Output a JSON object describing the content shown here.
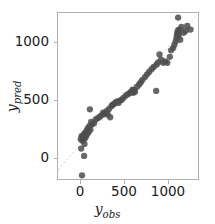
{
  "figure": {
    "background": "#ffffff",
    "plot_box_color": "#b0b0b0"
  },
  "axes": {
    "xlabel_var": "y",
    "xlabel_sub": "obs",
    "ylabel_var": "y",
    "ylabel_sub": "pred",
    "x_ticks": [
      "0",
      "500",
      "1000"
    ],
    "y_ticks": [
      "0",
      "500",
      "1000"
    ]
  },
  "chart_data": {
    "type": "scatter",
    "title": "",
    "xlabel": "y_obs",
    "ylabel": "y_pred",
    "xlim": [
      -260,
      1430
    ],
    "ylim": [
      -360,
      1440
    ],
    "x_ticks": [
      0,
      500,
      1000
    ],
    "y_ticks": [
      0,
      500,
      1000
    ],
    "grid": false,
    "legend": null,
    "marker_color": "#4d4d4d",
    "marker_size": 3.2,
    "marker_alpha": 0.85,
    "reference_line": {
      "name": "identity",
      "style": "dashed",
      "color": "#c8c8c8",
      "slope": 1,
      "intercept": 0,
      "from": [
        -260,
        -260
      ],
      "to": [
        1400,
        1400
      ]
    },
    "series": [
      {
        "name": "predictions",
        "points": [
          [
            30,
            -320
          ],
          [
            55,
            -110
          ],
          [
            20,
            -30
          ],
          [
            60,
            20
          ],
          [
            35,
            55
          ],
          [
            15,
            70
          ],
          [
            45,
            75
          ],
          [
            70,
            85
          ],
          [
            30,
            95
          ],
          [
            60,
            100
          ],
          [
            25,
            105
          ],
          [
            80,
            110
          ],
          [
            50,
            120
          ],
          [
            95,
            130
          ],
          [
            65,
            140
          ],
          [
            110,
            150
          ],
          [
            85,
            165
          ],
          [
            130,
            175
          ],
          [
            100,
            190
          ],
          [
            120,
            215
          ],
          [
            150,
            230
          ],
          [
            175,
            245
          ],
          [
            140,
            260
          ],
          [
            195,
            285
          ],
          [
            220,
            300
          ],
          [
            125,
            395
          ],
          [
            245,
            315
          ],
          [
            265,
            330
          ],
          [
            300,
            345
          ],
          [
            285,
            360
          ],
          [
            325,
            375
          ],
          [
            340,
            340
          ],
          [
            355,
            400
          ],
          [
            370,
            310
          ],
          [
            385,
            430
          ],
          [
            400,
            445
          ],
          [
            420,
            455
          ],
          [
            435,
            470
          ],
          [
            455,
            480
          ],
          [
            470,
            465
          ],
          [
            490,
            490
          ],
          [
            510,
            500
          ],
          [
            530,
            520
          ],
          [
            560,
            545
          ],
          [
            585,
            560
          ],
          [
            610,
            575
          ],
          [
            625,
            585
          ],
          [
            635,
            590
          ],
          [
            645,
            595
          ],
          [
            655,
            600
          ],
          [
            660,
            605
          ],
          [
            670,
            585
          ],
          [
            640,
            610
          ],
          [
            650,
            575
          ],
          [
            695,
            640
          ],
          [
            720,
            665
          ],
          [
            740,
            690
          ],
          [
            760,
            715
          ],
          [
            790,
            745
          ],
          [
            815,
            775
          ],
          [
            840,
            800
          ],
          [
            870,
            830
          ],
          [
            895,
            855
          ],
          [
            925,
            595
          ],
          [
            930,
            880
          ],
          [
            950,
            905
          ],
          [
            965,
            990
          ],
          [
            985,
            935
          ],
          [
            1010,
            900
          ],
          [
            1035,
            915
          ],
          [
            1060,
            900
          ],
          [
            1090,
            965
          ],
          [
            1105,
            1035
          ],
          [
            1130,
            1060
          ],
          [
            1145,
            1095
          ],
          [
            1160,
            1130
          ],
          [
            1170,
            1165
          ],
          [
            1175,
            1200
          ],
          [
            1180,
            1230
          ],
          [
            1190,
            1255
          ],
          [
            1195,
            1190
          ],
          [
            1200,
            1225
          ],
          [
            1205,
            1260
          ],
          [
            1215,
            1150
          ],
          [
            1230,
            1290
          ],
          [
            1190,
            1390
          ],
          [
            1255,
            1225
          ],
          [
            1280,
            1245
          ],
          [
            1300,
            1300
          ],
          [
            1340,
            1260
          ]
        ]
      }
    ]
  }
}
